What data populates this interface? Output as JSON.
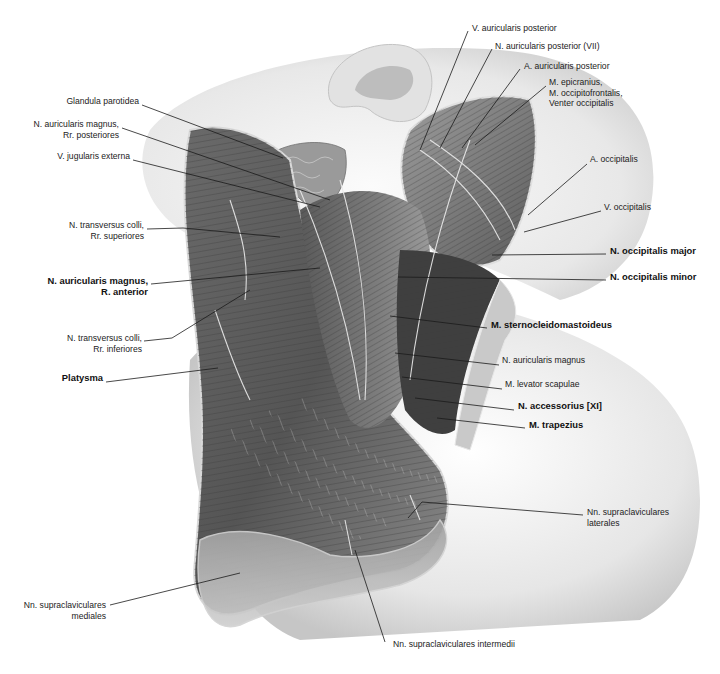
{
  "figure": {
    "colors": {
      "background": "#ffffff",
      "body_shadow": "#c8c8c8",
      "muscle_dark": "#4a4a4a",
      "muscle_mid": "#7a7a7a",
      "muscle_light": "#b5b5b5",
      "skin_edge": "#d9d9d9",
      "nerve": "#e8e8e8",
      "leader_line": "#1a1a1a"
    }
  },
  "labels": {
    "left": [
      {
        "id": "glandula-parotidea",
        "text": "Glandula parotidea",
        "bold": false,
        "x": 139,
        "y": 102,
        "line": [
          [
            142,
            105
          ],
          [
            283,
            158
          ]
        ]
      },
      {
        "id": "n-auricularis-magnus-rr-posteriores",
        "text": "N. auricularis magnus,\nRr. posteriores",
        "bold": false,
        "x": 119,
        "y": 125,
        "line": [
          [
            122,
            128
          ],
          [
            330,
            200
          ]
        ]
      },
      {
        "id": "v-jugularis-externa",
        "text": "V. jugularis externa",
        "bold": false,
        "x": 130,
        "y": 157,
        "line": [
          [
            133,
            160
          ],
          [
            320,
            207
          ]
        ]
      },
      {
        "id": "n-transversus-colli-rr-superiores",
        "text": "N. transversus colli,\nRr. superiores",
        "bold": false,
        "x": 144,
        "y": 226,
        "line": [
          [
            147,
            229
          ],
          [
            183,
            228
          ],
          [
            280,
            237
          ]
        ]
      },
      {
        "id": "n-auricularis-magnus-r-anterior",
        "text": "N. auricularis magnus,\nR. anterior",
        "bold": true,
        "x": 148,
        "y": 281,
        "line": [
          [
            151,
            284
          ],
          [
            320,
            268
          ]
        ]
      },
      {
        "id": "n-transversus-colli-rr-inferiores",
        "text": "N. transversus colli,\nRr. inferiores",
        "bold": false,
        "x": 142,
        "y": 339,
        "line": [
          [
            144,
            341
          ],
          [
            172,
            338
          ],
          [
            250,
            290
          ]
        ]
      },
      {
        "id": "platysma",
        "text": "Platysma",
        "bold": true,
        "x": 103,
        "y": 378,
        "line": [
          [
            106,
            382
          ],
          [
            218,
            368
          ]
        ]
      },
      {
        "id": "nn-supraclaviculares-mediales",
        "text": "Nn. supraclaviculares\nmediales",
        "bold": false,
        "x": 106,
        "y": 606,
        "line": [
          [
            110,
            605
          ],
          [
            240,
            573
          ]
        ]
      }
    ],
    "right": [
      {
        "id": "v-auricularis-posterior",
        "text": "V. auricularis posterior",
        "bold": false,
        "x": 472,
        "y": 29,
        "line": [
          [
            468,
            31
          ],
          [
            420,
            150
          ]
        ]
      },
      {
        "id": "n-auricularis-posterior-vii",
        "text": "N. auricularis posterior (VII)",
        "bold": false,
        "x": 495,
        "y": 47,
        "line": [
          [
            492,
            49
          ],
          [
            440,
            148
          ]
        ]
      },
      {
        "id": "a-auricularis-posterior",
        "text": "A. auricularis posterior",
        "bold": false,
        "x": 524,
        "y": 67,
        "line": [
          [
            520,
            69
          ],
          [
            462,
            148
          ]
        ]
      },
      {
        "id": "m-epicranius",
        "text": "M. epicranius,\nM. occipitofrontalis,\nVenter occipitalis",
        "bold": false,
        "x": 549,
        "y": 83,
        "line": [
          [
            546,
            86
          ],
          [
            475,
            145
          ]
        ]
      },
      {
        "id": "a-occipitalis",
        "text": "A. occipitalis",
        "bold": false,
        "x": 590,
        "y": 160,
        "line": [
          [
            587,
            164
          ],
          [
            528,
            215
          ]
        ]
      },
      {
        "id": "v-occipitalis",
        "text": "V. occipitalis",
        "bold": false,
        "x": 604,
        "y": 208,
        "line": [
          [
            601,
            211
          ],
          [
            524,
            232
          ]
        ]
      },
      {
        "id": "n-occipitalis-major",
        "text": "N. occipitalis major",
        "bold": true,
        "x": 610,
        "y": 251,
        "line": [
          [
            606,
            254
          ],
          [
            492,
            255
          ]
        ]
      },
      {
        "id": "n-occipitalis-minor",
        "text": "N. occipitalis minor",
        "bold": true,
        "x": 610,
        "y": 277,
        "line": [
          [
            606,
            280
          ],
          [
            398,
            277
          ]
        ]
      },
      {
        "id": "m-sternocleidomastoideus",
        "text": "M. sternocleidomastoideus",
        "bold": true,
        "x": 491,
        "y": 325,
        "line": [
          [
            487,
            328
          ],
          [
            390,
            316
          ]
        ]
      },
      {
        "id": "n-auricularis-magnus",
        "text": "N. auricularis magnus",
        "bold": false,
        "x": 502,
        "y": 361,
        "line": [
          [
            499,
            365
          ],
          [
            395,
            353
          ]
        ]
      },
      {
        "id": "m-levator-scapulae",
        "text": "M. levator scapulae",
        "bold": false,
        "x": 505,
        "y": 385,
        "line": [
          [
            502,
            389
          ],
          [
            402,
            377
          ]
        ]
      },
      {
        "id": "n-accessorius-xi",
        "text": "N. accessorius [XI]",
        "bold": true,
        "x": 518,
        "y": 406,
        "line": [
          [
            514,
            410
          ],
          [
            415,
            398
          ]
        ]
      },
      {
        "id": "m-trapezius",
        "text": "M. trapezius",
        "bold": true,
        "x": 529,
        "y": 425,
        "line": [
          [
            525,
            428
          ],
          [
            437,
            418
          ]
        ]
      },
      {
        "id": "nn-supraclaviculares-laterales",
        "text": "Nn. supraclaviculares\nlaterales",
        "bold": false,
        "x": 587,
        "y": 513,
        "line": [
          [
            583,
            515
          ],
          [
            422,
            502
          ],
          [
            408,
            518
          ]
        ]
      },
      {
        "id": "nn-supraclaviculares-intermedii",
        "text": "Nn. supraclaviculares intermedii",
        "bold": false,
        "x": 393,
        "y": 645,
        "line": [
          [
            385,
            642
          ],
          [
            355,
            550
          ]
        ]
      }
    ]
  }
}
